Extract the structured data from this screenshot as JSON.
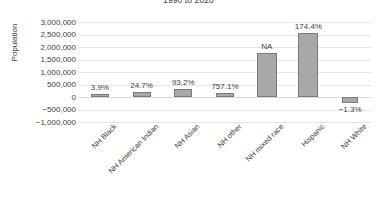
{
  "chart_data": {
    "type": "bar",
    "title": "1990 to 2020",
    "xlabel": "",
    "ylabel": "Population",
    "ylim": [
      -1000000,
      3000000
    ],
    "ytick_labels": [
      "3,000,000",
      "2,500,000",
      "2,000,000",
      "1,500,000",
      "1,000,000",
      "500,000",
      "0",
      "-500,000",
      "-1,000,000"
    ],
    "ytick_values": [
      3000000,
      2500000,
      2000000,
      1500000,
      1000000,
      500000,
      0,
      -500000,
      -1000000
    ],
    "grid": true,
    "legend": "none",
    "categories": [
      "NH Black",
      "NH American Indian",
      "NH Asian",
      "NH other",
      "NH mixed race",
      "Hispanic",
      "NH White"
    ],
    "values": [
      130000,
      190000,
      310000,
      150000,
      1750000,
      2550000,
      -230000
    ],
    "data_labels": [
      "3.9%",
      "24.7%",
      "93.2%",
      "757.1%",
      "NA",
      "174.4%",
      "-1.3%"
    ],
    "bar_color": "#a8a8a8",
    "bar_border_color": "#7b7b7b",
    "grid_color": "#e4e4e4",
    "text_color": "#404040"
  }
}
